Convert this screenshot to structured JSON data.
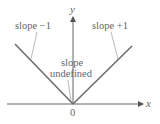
{
  "diagram": {
    "colors": {
      "axis": "#555555",
      "curve": "#6e6e6e",
      "text": "#666666",
      "leader": "#888888"
    },
    "axes": {
      "x_label": "x",
      "y_label": "y",
      "origin_label": "0"
    },
    "annotations": {
      "left_slope": "slope −1",
      "right_slope": "slope +1",
      "vertex_line1": "slope",
      "vertex_line2": "undefined"
    }
  }
}
